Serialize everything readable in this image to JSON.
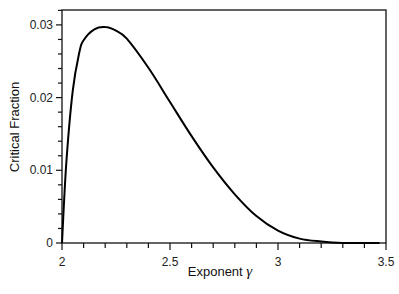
{
  "chart_data": {
    "type": "line",
    "title": "",
    "xlabel": "Exponent γ",
    "ylabel": "Critical Fraction",
    "xlim": [
      2,
      3.5
    ],
    "ylim": [
      0,
      0.032
    ],
    "xticks": [
      "2",
      "2.5",
      "3",
      "3.5"
    ],
    "yticks": [
      "0",
      "0.01",
      "0.02",
      "0.03"
    ],
    "grid": false,
    "legend": null,
    "series": [
      {
        "name": "critical fraction",
        "x": [
          2.0,
          2.02,
          2.05,
          2.08,
          2.1,
          2.15,
          2.2,
          2.25,
          2.3,
          2.4,
          2.5,
          2.6,
          2.7,
          2.8,
          2.9,
          3.0,
          3.1,
          3.2,
          3.3,
          3.4,
          3.47
        ],
        "y": [
          0.0,
          0.011,
          0.021,
          0.0262,
          0.0279,
          0.0294,
          0.0297,
          0.0292,
          0.0281,
          0.0241,
          0.0194,
          0.0147,
          0.0104,
          0.0067,
          0.0037,
          0.0017,
          0.0006,
          0.0002,
          0.0,
          0.0,
          0.0
        ]
      }
    ]
  },
  "axes": {
    "x_label_prefix": "Exponent ",
    "x_label_symbol": "γ",
    "y_label": "Critical Fraction"
  }
}
